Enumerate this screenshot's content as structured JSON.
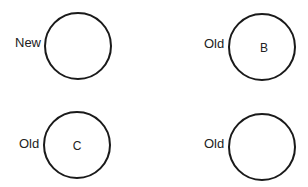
{
  "diagram": {
    "stroke_color": "#1a1a1a",
    "nodes": [
      {
        "id": "top-left",
        "side_label": "New",
        "inner_label": ""
      },
      {
        "id": "top-right",
        "side_label": "Old",
        "inner_label": "B"
      },
      {
        "id": "bottom-left",
        "side_label": "Old",
        "inner_label": "C"
      },
      {
        "id": "bottom-right",
        "side_label": "Old",
        "inner_label": ""
      }
    ]
  }
}
